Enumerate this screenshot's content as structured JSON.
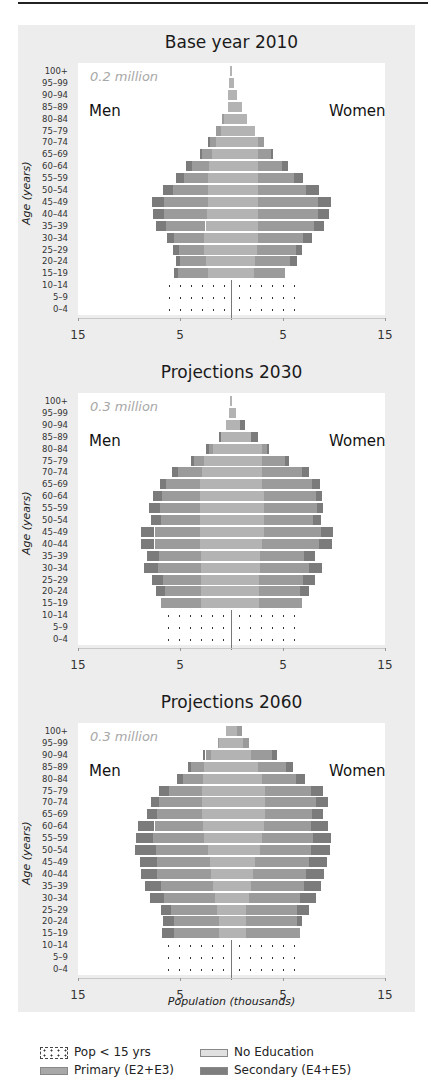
{
  "figure": {
    "ylabel": "Age (years)",
    "xlabel": "Population (thousands)",
    "x_tick_labels": [
      "15",
      "5",
      "5",
      "15"
    ],
    "age_groups": [
      "100+",
      "95–99",
      "90–94",
      "85–89",
      "80–84",
      "75–79",
      "70–74",
      "65–69",
      "60–64",
      "55–59",
      "50–54",
      "45–49",
      "40–44",
      "35–39",
      "30–34",
      "25–29",
      "20–24",
      "15–19",
      "10–14",
      "5–9",
      "0–4"
    ],
    "men_label": "Men",
    "women_label": "Women"
  },
  "legend": {
    "items": [
      {
        "label": "Pop < 15 yrs",
        "swatch": "dots"
      },
      {
        "label": "No Education",
        "swatch": "noed"
      },
      {
        "label": "Primary (E2+E3)",
        "swatch": "prim"
      },
      {
        "label": "Secondary (E4+E5)",
        "swatch": "sec"
      }
    ]
  },
  "colors": {
    "no_education": "#b3b3b3",
    "primary": "#9b9b9b",
    "secondary": "#7b7b7b",
    "plot_background": "#ffffff",
    "figure_background": "#ededed"
  },
  "chart_data": [
    {
      "type": "bar",
      "subtype": "population-pyramid",
      "title": "Base year 2010",
      "annotation": "0.2 million",
      "xlabel": "Population (thousands)",
      "ylabel": "Age (years)",
      "xlim": [
        -15,
        15
      ],
      "categories": [
        "100+",
        "95–99",
        "90–94",
        "85–89",
        "80–84",
        "75–79",
        "70–74",
        "65–69",
        "60–64",
        "55–59",
        "50–54",
        "45–49",
        "40–44",
        "35–39",
        "30–34",
        "25–29",
        "20–24",
        "15–19",
        "10–14",
        "5–9",
        "0–4"
      ],
      "series": [
        {
          "name": "Men - No Education",
          "values": [
            0.1,
            0.2,
            0.3,
            0.3,
            0.7,
            1.0,
            1.5,
            1.9,
            2.2,
            2.3,
            2.3,
            2.3,
            2.4,
            2.5,
            2.6,
            2.6,
            2.5,
            2.3,
            0,
            0,
            0
          ]
        },
        {
          "name": "Men - Primary (E2+E3)",
          "values": [
            0,
            0,
            0,
            0,
            0.2,
            0.5,
            0.6,
            0.9,
            1.6,
            2.3,
            3.4,
            4.3,
            4.2,
            3.9,
            3.0,
            2.5,
            2.5,
            2.9,
            0,
            0,
            0
          ]
        },
        {
          "name": "Men - Secondary (E4+E5)",
          "values": [
            0,
            0,
            0,
            0,
            0,
            0,
            0.2,
            0.2,
            0.6,
            0.8,
            1.0,
            1.1,
            1.0,
            1.0,
            0.7,
            0.6,
            0.4,
            0.4,
            0,
            0,
            0
          ]
        },
        {
          "name": "Men - Pop < 15 yrs",
          "values": [
            0,
            0,
            0,
            0,
            0,
            0,
            0,
            0,
            0,
            0,
            0,
            0,
            0,
            0,
            0,
            0,
            0,
            0,
            6.9,
            6.9,
            6.9
          ]
        },
        {
          "name": "Women - No Education",
          "values": [
            0.1,
            0.3,
            0.6,
            1.1,
            1.6,
            2.4,
            2.6,
            2.6,
            2.6,
            2.6,
            2.6,
            2.6,
            2.6,
            2.6,
            2.6,
            2.5,
            2.4,
            2.3,
            0,
            0,
            0
          ]
        },
        {
          "name": "Women - Primary (E2+E3)",
          "values": [
            0,
            0,
            0,
            0,
            0,
            0,
            0.6,
            1.3,
            2.4,
            3.6,
            4.8,
            5.9,
            5.9,
            5.5,
            4.5,
            3.9,
            3.4,
            3.0,
            0,
            0,
            0
          ]
        },
        {
          "name": "Women - Secondary (E4+E5)",
          "values": [
            0,
            0,
            0,
            0,
            0,
            0,
            0,
            0.2,
            0.6,
            0.9,
            1.2,
            1.3,
            1.1,
            1.0,
            0.8,
            0.6,
            0.7,
            0,
            0,
            0,
            0
          ]
        },
        {
          "name": "Women - Pop < 15 yrs",
          "values": [
            0,
            0,
            0,
            0,
            0,
            0,
            0,
            0,
            0,
            0,
            0,
            0,
            0,
            0,
            0,
            0,
            0,
            0,
            6.8,
            6.8,
            6.8
          ]
        }
      ]
    },
    {
      "type": "bar",
      "subtype": "population-pyramid",
      "title": "Projections 2030",
      "annotation": "0.3 million",
      "xlabel": "Population (thousands)",
      "ylabel": "Age (years)",
      "xlim": [
        -15,
        15
      ],
      "categories": [
        "100+",
        "95–99",
        "90–94",
        "85–89",
        "80–84",
        "75–79",
        "70–74",
        "65–69",
        "60–64",
        "55–59",
        "50–54",
        "45–49",
        "40–44",
        "35–39",
        "30–34",
        "25–29",
        "20–24",
        "15–19",
        "10–14",
        "5–9",
        "0–4"
      ],
      "series": [
        {
          "name": "Men - No Education",
          "values": [
            0.1,
            0.2,
            0.5,
            1.0,
            1.8,
            2.6,
            2.8,
            3.0,
            3.0,
            3.0,
            3.0,
            3.0,
            3.0,
            2.9,
            2.9,
            2.9,
            2.9,
            2.9,
            0,
            0,
            0
          ]
        },
        {
          "name": "Men - Primary (E2+E3)",
          "values": [
            0,
            0,
            0,
            0,
            0.4,
            1.0,
            2.4,
            3.4,
            3.8,
            4.0,
            3.9,
            4.5,
            4.5,
            4.2,
            4.3,
            3.8,
            3.6,
            4.0,
            0,
            0,
            0
          ]
        },
        {
          "name": "Men - Secondary (E4+E5)",
          "values": [
            0,
            0,
            0,
            0.2,
            0.3,
            0.3,
            0.6,
            0.6,
            0.8,
            1.0,
            0.9,
            1.3,
            1.3,
            1.1,
            1.3,
            1.0,
            0.9,
            0,
            0,
            0,
            0
          ]
        },
        {
          "name": "Men - Pop < 15 yrs",
          "values": [
            0,
            0,
            0,
            0,
            0,
            0,
            0,
            0,
            0,
            0,
            0,
            0,
            0,
            0,
            0,
            0,
            0,
            0,
            7.0,
            7.0,
            7.0
          ]
        },
        {
          "name": "Women - No Education",
          "values": [
            0.1,
            0.5,
            0.9,
            2.0,
            3.0,
            3.0,
            3.0,
            3.0,
            3.2,
            3.2,
            3.2,
            3.2,
            3.0,
            2.8,
            2.8,
            2.7,
            2.7,
            2.7,
            0,
            0,
            0
          ]
        },
        {
          "name": "Women - Primary (E2+E3)",
          "values": [
            0,
            0,
            0,
            0,
            0.5,
            2.3,
            4.0,
            4.9,
            5.1,
            5.2,
            4.8,
            5.6,
            5.6,
            4.4,
            4.8,
            4.4,
            4.1,
            4.3,
            0,
            0,
            0
          ]
        },
        {
          "name": "Women - Secondary (E4+E5)",
          "values": [
            0,
            0,
            0.5,
            0.6,
            0.2,
            0.4,
            0.6,
            0.8,
            0.6,
            0.6,
            0.8,
            1.2,
            1.3,
            1.0,
            1.3,
            1.1,
            0.8,
            0,
            0,
            0,
            0
          ]
        },
        {
          "name": "Women - Pop < 15 yrs",
          "values": [
            0,
            0,
            0,
            0,
            0,
            0,
            0,
            0,
            0,
            0,
            0,
            0,
            0,
            0,
            0,
            0,
            0,
            0,
            6.7,
            6.7,
            6.7
          ]
        }
      ]
    },
    {
      "type": "bar",
      "subtype": "population-pyramid",
      "title": "Projections 2060",
      "annotation": "0.3 million",
      "xlabel": "Population (thousands)",
      "ylabel": "Age (years)",
      "xlim": [
        -15,
        15
      ],
      "categories": [
        "100+",
        "95–99",
        "90–94",
        "85–89",
        "80–84",
        "75–79",
        "70–74",
        "65–69",
        "60–64",
        "55–59",
        "50–54",
        "45–49",
        "40–44",
        "35–39",
        "30–34",
        "25–29",
        "20–24",
        "15–19",
        "10–14",
        "5–9",
        "0–4"
      ],
      "series": [
        {
          "name": "Men - No Education",
          "values": [
            0.5,
            1.2,
            2.0,
            2.6,
            2.7,
            2.8,
            2.8,
            2.8,
            2.7,
            2.6,
            2.3,
            2.1,
            2.0,
            1.8,
            1.6,
            1.4,
            1.2,
            1.2,
            0,
            0,
            0
          ]
        },
        {
          "name": "Men - Primary (E2+E3)",
          "values": [
            0,
            0.1,
            0.5,
            1.3,
            2.0,
            3.3,
            4.3,
            4.5,
            4.8,
            5.0,
            5.1,
            5.2,
            5.3,
            5.1,
            5.0,
            4.5,
            4.4,
            4.4,
            0,
            0,
            0
          ]
        },
        {
          "name": "Men - Secondary (E4+E5)",
          "values": [
            0,
            0,
            0.2,
            0.3,
            0.6,
            1.0,
            0.7,
            0.9,
            1.6,
            1.7,
            2.0,
            1.6,
            1.5,
            1.5,
            1.3,
            1.0,
            1.1,
            1.2,
            0,
            0,
            0
          ]
        },
        {
          "name": "Men - Pop < 15 yrs",
          "values": [
            0,
            0,
            0,
            0,
            0,
            0,
            0,
            0,
            0,
            0,
            0,
            0,
            0,
            0,
            0,
            0,
            0,
            0,
            7.0,
            7.0,
            7.0
          ]
        },
        {
          "name": "Women - No Education",
          "values": [
            0.6,
            1.2,
            2.0,
            2.6,
            3.0,
            3.3,
            3.3,
            3.3,
            3.2,
            3.0,
            2.8,
            2.4,
            2.2,
            2.0,
            1.8,
            1.5,
            1.5,
            1.5,
            0,
            0,
            0
          ]
        },
        {
          "name": "Women - Primary (E2+E3)",
          "values": [
            0.5,
            0.6,
            2.0,
            2.8,
            3.4,
            4.5,
            5.0,
            4.6,
            4.6,
            5.0,
            5.0,
            5.2,
            5.2,
            5.2,
            5.0,
            5.0,
            5.0,
            5.3,
            0,
            0,
            0
          ]
        },
        {
          "name": "Women - Secondary (E4+E5)",
          "values": [
            0,
            0,
            0.5,
            0.7,
            0.9,
            1.2,
            1.2,
            1.1,
            1.7,
            1.8,
            1.9,
            1.8,
            1.7,
            1.6,
            1.5,
            1.1,
            0.5,
            0,
            0,
            0,
            0
          ]
        },
        {
          "name": "Women - Pop < 15 yrs",
          "values": [
            0,
            0,
            0,
            0,
            0,
            0,
            0,
            0,
            0,
            0,
            0,
            0,
            0,
            0,
            0,
            0,
            0,
            0,
            6.6,
            6.6,
            6.6
          ]
        }
      ]
    }
  ],
  "panels": [
    {
      "title": "Base year 2010",
      "annotation": "0.2 million"
    },
    {
      "title": "Projections 2030",
      "annotation": "0.3 million"
    },
    {
      "title": "Projections 2060",
      "annotation": "0.3 million"
    }
  ]
}
